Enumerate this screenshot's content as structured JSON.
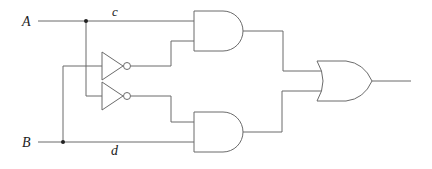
{
  "diagram": {
    "type": "logic-circuit",
    "inputs": [
      {
        "name": "A",
        "label": "A"
      },
      {
        "name": "B",
        "label": "B"
      }
    ],
    "wire_labels": {
      "c": "c",
      "d": "d"
    },
    "gates": [
      {
        "id": "not1",
        "type": "NOT",
        "input": "B",
        "output": "not_B"
      },
      {
        "id": "not2",
        "type": "NOT",
        "input": "A",
        "output": "not_A"
      },
      {
        "id": "and1",
        "type": "AND",
        "inputs": [
          "A",
          "not_B"
        ]
      },
      {
        "id": "and2",
        "type": "AND",
        "inputs": [
          "not_A",
          "B"
        ]
      },
      {
        "id": "or1",
        "type": "OR",
        "inputs": [
          "and1",
          "and2"
        ]
      }
    ],
    "colors": {
      "wire": "#6b6b6b",
      "junction": "#222222",
      "text": "#222222"
    }
  }
}
